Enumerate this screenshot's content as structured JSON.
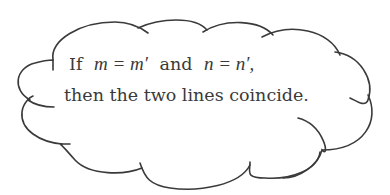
{
  "cloud": {
    "stroke_color": "#3a3a3a",
    "background": "#ffffff"
  },
  "text": {
    "line1": {
      "if": "If",
      "expr1": "m = m′",
      "and": "and",
      "expr2": "n = n′,"
    },
    "line2": "then the two lines coincide."
  }
}
